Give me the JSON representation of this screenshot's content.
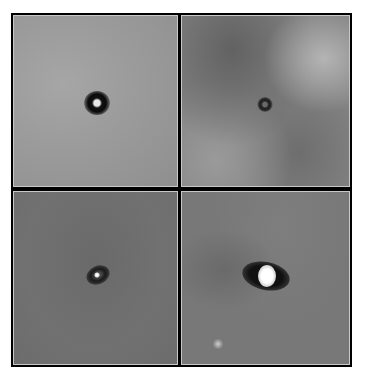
{
  "figure": {
    "layout": "2x2 grid",
    "panels": [
      {
        "id": "top-left",
        "background": "#9a9a9a",
        "description": "grey field with dark ring and bright core at center"
      },
      {
        "id": "top-right",
        "background": "#7e7e7e",
        "description": "mottled grey field with small dark ring at center"
      },
      {
        "id": "bottom-left",
        "background": "#6e6e6e",
        "description": "noisy grey field with small dark elongated ring and bright point"
      },
      {
        "id": "bottom-right",
        "background": "#767676",
        "description": "grey field with dark elongated disk and bright white core; faint point source lower-left"
      }
    ]
  }
}
